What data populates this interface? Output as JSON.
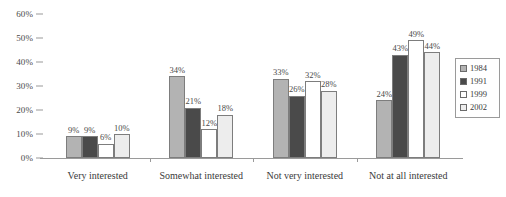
{
  "chart_data": {
    "type": "bar",
    "title": "",
    "subtitle": "",
    "xlabel": "",
    "ylabel": "",
    "ylim": [
      0,
      60
    ],
    "y_ticks": [
      0,
      10,
      20,
      30,
      40,
      50,
      60
    ],
    "y_tick_labels": [
      "0%",
      "10%",
      "20%",
      "30%",
      "40%",
      "50%",
      "60%"
    ],
    "grid": false,
    "legend_position": "right",
    "value_suffix": "%",
    "categories": [
      "Very interested",
      "Somewhat interested",
      "Not very interested",
      "Not at all interested"
    ],
    "series": [
      {
        "name": "1984",
        "color": "#b3b3b3",
        "values": [
          9,
          34,
          33,
          24
        ],
        "labels": [
          "9%",
          "34%",
          "33%",
          "24%"
        ]
      },
      {
        "name": "1991",
        "color": "#4a4a4a",
        "values": [
          9,
          21,
          26,
          43
        ],
        "labels": [
          "9%",
          "21%",
          "26%",
          "43%"
        ]
      },
      {
        "name": "1999",
        "color": "#ffffff",
        "values": [
          6,
          12,
          32,
          49
        ],
        "labels": [
          "6%",
          "12%",
          "32%",
          "49%"
        ]
      },
      {
        "name": "2002",
        "color": "#ededed",
        "values": [
          10,
          18,
          28,
          44
        ],
        "labels": [
          "10%",
          "18%",
          "28%",
          "44%"
        ]
      }
    ]
  },
  "style": {
    "axis_color": "#9a9a9a",
    "bar_outline": "#7d7d7d",
    "text_color": "#3a3a3a",
    "background": "#ffffff"
  }
}
